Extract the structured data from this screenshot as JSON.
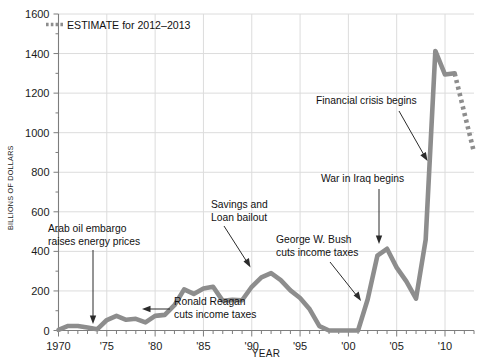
{
  "chart_data": {
    "type": "line",
    "title": "",
    "xlabel": "YEAR",
    "ylabel": "BILLIONS OF DOLLARS",
    "xlim": [
      1970,
      2013
    ],
    "ylim": [
      0,
      1600
    ],
    "grid": true,
    "legend_position": "top-left",
    "y_ticks": [
      0,
      200,
      400,
      600,
      800,
      1000,
      1200,
      1400,
      1600
    ],
    "y_tick_labels": [
      "0",
      "200",
      "400",
      "600",
      "800",
      "1000",
      "1200",
      "1400",
      "1600"
    ],
    "x_ticks": [
      1970,
      1975,
      1980,
      1985,
      1990,
      1995,
      2000,
      2005,
      2010
    ],
    "x_tick_labels": [
      "1970",
      "'75",
      "'80",
      "'85",
      "'90",
      "'95",
      "'00",
      "'05",
      "'10"
    ],
    "series": [
      {
        "name": "Federal budget deficit",
        "style": "solid",
        "color": "#8d8d8d",
        "x": [
          1970,
          1971,
          1972,
          1973,
          1974,
          1975,
          1976,
          1977,
          1978,
          1979,
          1980,
          1981,
          1982,
          1983,
          1984,
          1985,
          1986,
          1987,
          1988,
          1989,
          1990,
          1991,
          1992,
          1993,
          1994,
          1995,
          1996,
          1997,
          1998,
          1999,
          2000,
          2001,
          2002,
          2003,
          2004,
          2005,
          2006,
          2007,
          2008,
          2009,
          2010,
          2011
        ],
        "values": [
          3,
          23,
          23,
          15,
          6,
          53,
          74,
          54,
          59,
          41,
          74,
          79,
          128,
          208,
          185,
          212,
          221,
          150,
          155,
          153,
          221,
          269,
          290,
          255,
          203,
          164,
          107,
          22,
          0,
          0,
          0,
          0,
          158,
          378,
          413,
          318,
          248,
          161,
          459,
          1413,
          1294,
          1300
        ]
      },
      {
        "name": "ESTIMATE for 2012-2013",
        "style": "dotted",
        "color": "#8d8d8d",
        "x": [
          2011,
          2012,
          2013
        ],
        "values": [
          1300,
          1100,
          901
        ]
      }
    ],
    "legend": [
      {
        "label": "ESTIMATE for 2012–2013",
        "style": "dotted",
        "color": "#8d8d8d"
      }
    ],
    "annotations": [
      {
        "text_line1": "Arab oil embargo",
        "text_line2": "raises energy prices",
        "points_to_year": 1974,
        "points_to_value": 35
      },
      {
        "text_line1": "Ronald Reagan",
        "text_line2": "cuts income taxes",
        "points_to_year": 1981,
        "points_to_value": 80
      },
      {
        "text_line1": "Savings and",
        "text_line2": "Loan bailout",
        "points_to_year": 1991,
        "points_to_value": 265
      },
      {
        "text_line1": "George W. Bush",
        "text_line2": "cuts income taxes",
        "points_to_year": 2001,
        "points_to_value": 60
      },
      {
        "text_line1": "War in Iraq begins",
        "text_line2": "",
        "points_to_year": 2003,
        "points_to_value": 380
      },
      {
        "text_line1": "Financial crisis begins",
        "text_line2": "",
        "points_to_year": 2008,
        "points_to_value": 430
      }
    ]
  },
  "colors": {
    "line": "#8d8d8d",
    "grid": "#dcdcdc",
    "axis": "#7d7d7d",
    "text": "#1b1b1b",
    "background": "#ffffff"
  }
}
